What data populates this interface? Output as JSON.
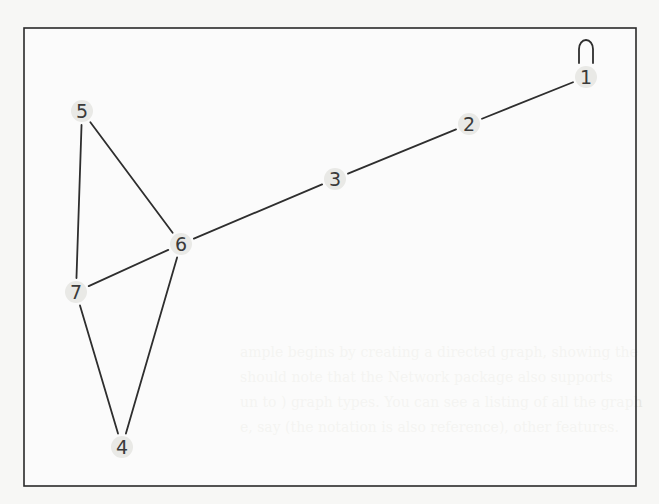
{
  "diagram": {
    "type": "undirected-graph",
    "frame": {
      "x": 24,
      "y": 28,
      "width": 612,
      "height": 458
    },
    "nodes": [
      {
        "id": "1",
        "label": "1",
        "x": 586,
        "y": 77
      },
      {
        "id": "2",
        "label": "2",
        "x": 469,
        "y": 124
      },
      {
        "id": "3",
        "label": "3",
        "x": 335,
        "y": 179
      },
      {
        "id": "4",
        "label": "4",
        "x": 122,
        "y": 447
      },
      {
        "id": "5",
        "label": "5",
        "x": 82,
        "y": 111
      },
      {
        "id": "6",
        "label": "6",
        "x": 181,
        "y": 244
      },
      {
        "id": "7",
        "label": "7",
        "x": 76,
        "y": 292
      }
    ],
    "edges": [
      {
        "from": "1",
        "to": "1",
        "self_loop": true
      },
      {
        "from": "1",
        "to": "2"
      },
      {
        "from": "2",
        "to": "3"
      },
      {
        "from": "3",
        "to": "6"
      },
      {
        "from": "5",
        "to": "6"
      },
      {
        "from": "5",
        "to": "7"
      },
      {
        "from": "6",
        "to": "7"
      },
      {
        "from": "6",
        "to": "4"
      },
      {
        "from": "7",
        "to": "4"
      }
    ],
    "colors": {
      "edge": "#2e2e2e",
      "label": "#3a3a3a",
      "frame": "#2a2a2a",
      "background": "#f7f7f5"
    }
  },
  "bleed_through": {
    "bottom_lines": [
      "ample begins by creating a directed graph, showing the ",
      "should note that the Network package also supports ",
      "un to ) graph types. You can see a listing of all the graph ",
      "e, say (the notation is also reference), other features. "
    ]
  }
}
